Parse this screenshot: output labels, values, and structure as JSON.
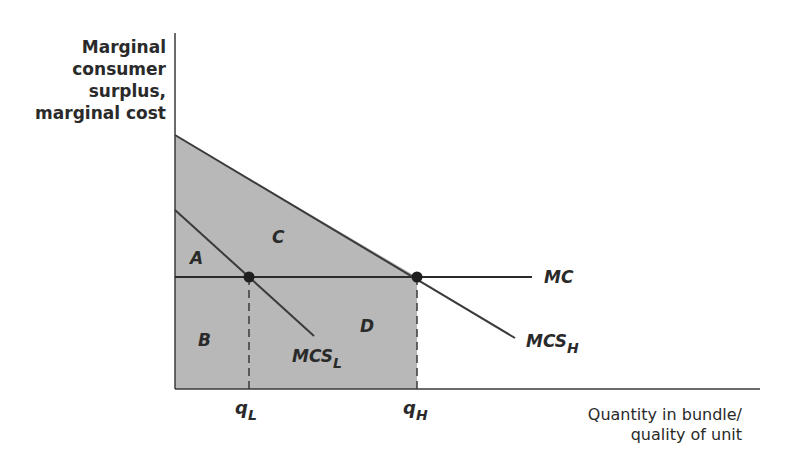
{
  "diagram": {
    "title": "",
    "y_axis_label": [
      "Marginal",
      "consumer",
      "surplus,",
      "marginal cost"
    ],
    "x_axis_label": [
      "Quantity in  bundle/",
      "quality of unit"
    ],
    "curves": {
      "mc": "MC",
      "mcs_high": {
        "base": "MCS",
        "sub": "H"
      },
      "mcs_low": {
        "base": "MCS",
        "sub": "L"
      }
    },
    "regions": {
      "a": "A",
      "b": "B",
      "c": "C",
      "d": "D"
    },
    "x_ticks": {
      "q_low": {
        "base": "q",
        "sub": "L"
      },
      "q_high": {
        "base": "q",
        "sub": "H"
      }
    },
    "colors": {
      "shade": "#b8b8b8",
      "line": "#3a3a3a",
      "text": "#2a2a2a"
    }
  }
}
